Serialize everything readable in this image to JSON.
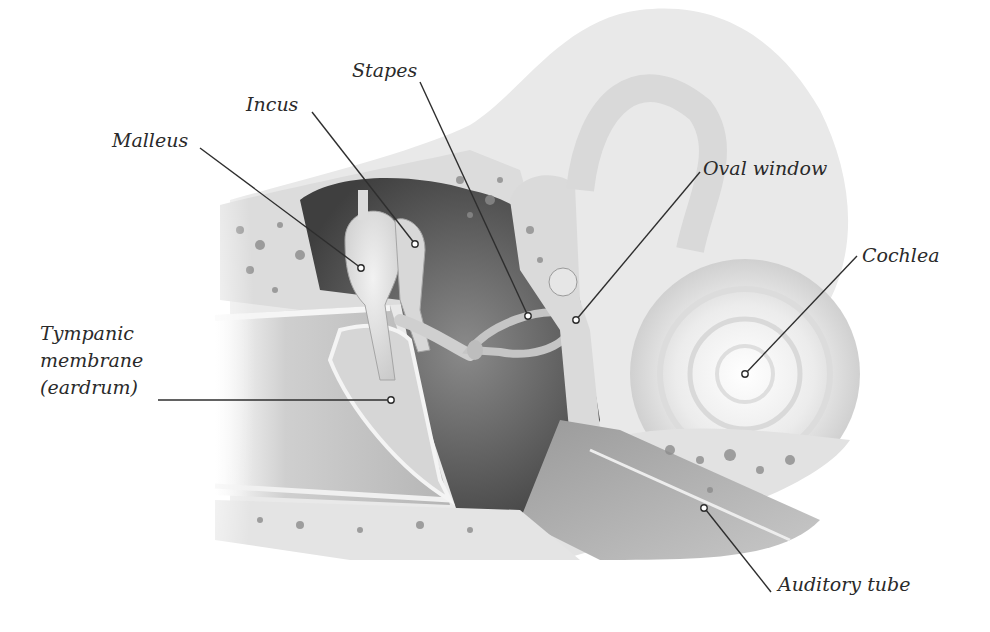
{
  "diagram": {
    "labels": [
      {
        "id": "malleus",
        "text": "Malleus",
        "x": 112,
        "y": 128,
        "line": [
          [
            200,
            148
          ],
          [
            361,
            268
          ]
        ]
      },
      {
        "id": "incus",
        "text": "Incus",
        "x": 246,
        "y": 92,
        "line": [
          [
            312,
            112
          ],
          [
            415,
            244
          ]
        ]
      },
      {
        "id": "stapes",
        "text": "Stapes",
        "x": 352,
        "y": 58,
        "line": [
          [
            420,
            82
          ],
          [
            528,
            316
          ]
        ]
      },
      {
        "id": "oval-window",
        "text": "Oval window",
        "x": 703,
        "y": 156,
        "line": [
          [
            700,
            172
          ],
          [
            576,
            320
          ]
        ]
      },
      {
        "id": "cochlea",
        "text": "Cochlea",
        "x": 862,
        "y": 243,
        "line": [
          [
            857,
            256
          ],
          [
            745,
            374
          ]
        ]
      },
      {
        "id": "tympanic-membrane",
        "text": "Tympanic\nmembrane\n(eardrum)",
        "x": 40,
        "y": 320,
        "line": [
          [
            158,
            400
          ],
          [
            390,
            400
          ]
        ]
      },
      {
        "id": "auditory-tube",
        "text": "Auditory tube",
        "x": 778,
        "y": 572,
        "line": [
          [
            771,
            592
          ],
          [
            704,
            508
          ]
        ]
      }
    ],
    "colors": {
      "label_text": "#2a2a2a",
      "leader_line": "#2e2e2e",
      "bone_light": "#e6e6e6",
      "bone_mid": "#bdbdbd",
      "cavity_dark": "#5a5a5a",
      "background": "#ffffff"
    }
  }
}
